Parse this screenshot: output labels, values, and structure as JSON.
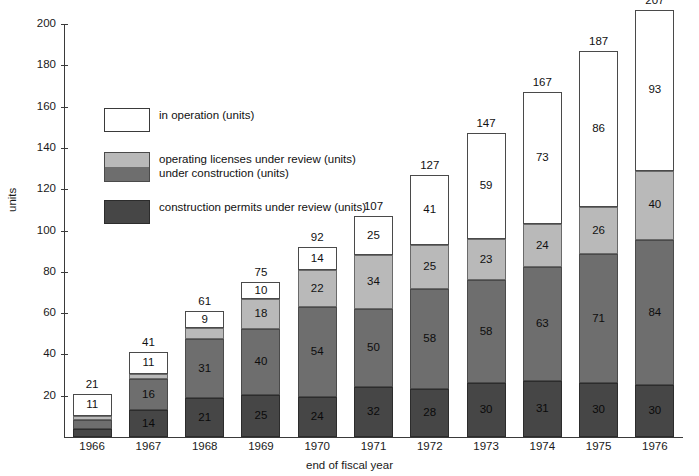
{
  "chart_data": {
    "type": "bar",
    "subtype": "stacked-bar",
    "title": "",
    "xlabel": "end of fiscal year",
    "ylabel": "units",
    "ylim": [
      0,
      200
    ],
    "ytick_step": 20,
    "yticks": [
      0,
      20,
      40,
      60,
      80,
      100,
      120,
      140,
      160,
      180,
      200
    ],
    "grid": false,
    "legend_position": "inside-upper-left",
    "categories": [
      "1966",
      "1967",
      "1968",
      "1969",
      "1970",
      "1971",
      "1972",
      "1973",
      "1974",
      "1975",
      "1976"
    ],
    "series": [
      {
        "name": "in operation (units)",
        "key": "operation",
        "color": "#ffffff",
        "values": [
          11,
          11,
          9,
          10,
          14,
          25,
          41,
          59,
          73,
          86,
          93
        ]
      },
      {
        "name": "operating licenses under review (units)",
        "key": "licenses",
        "color": "#b9b9b9",
        "values": [
          2,
          3,
          6,
          18,
          22,
          34,
          25,
          23,
          24,
          26,
          40
        ]
      },
      {
        "name": "under construction (units)",
        "key": "construction",
        "color": "#6e6e6e",
        "values": [
          4,
          16,
          31,
          40,
          54,
          50,
          58,
          58,
          63,
          71,
          84
        ]
      },
      {
        "name": "construction permits under review (units)",
        "key": "permits",
        "color": "#464646",
        "values": [
          4,
          14,
          21,
          25,
          24,
          32,
          28,
          30,
          31,
          30,
          30
        ]
      }
    ],
    "totals": [
      21,
      41,
      61,
      75,
      92,
      107,
      127,
      147,
      167,
      187,
      207
    ],
    "segment_labels": {
      "operation": [
        "11",
        "11",
        "9",
        "10",
        "14",
        "25",
        "41",
        "59",
        "73",
        "86",
        "93"
      ],
      "licenses": [
        "",
        "3",
        "6",
        "18",
        "22",
        "34",
        "25",
        "23",
        "24",
        "26",
        "40"
      ],
      "construction": [
        "",
        "16",
        "31",
        "40",
        "54",
        "50",
        "58",
        "58",
        "63",
        "71",
        "84"
      ],
      "permits": [
        "",
        "14",
        "21",
        "25",
        "24",
        "32",
        "28",
        "30",
        "31",
        "30",
        "30"
      ]
    }
  },
  "axes": {
    "y_title": "units",
    "x_title": "end of fiscal year",
    "y_tick_labels": [
      "0",
      "20",
      "40",
      "60",
      "80",
      "100",
      "120",
      "140",
      "160",
      "180",
      "200"
    ],
    "x_tick_labels": [
      "1966",
      "1967",
      "1968",
      "1969",
      "1970",
      "1971",
      "1972",
      "1973",
      "1974",
      "1975",
      "1976"
    ]
  },
  "legend": {
    "items": [
      {
        "label": "in operation (units)",
        "swatch": "white"
      },
      {
        "label": "operating licenses under review (units)",
        "swatch": "light-gray"
      },
      {
        "label": "under construction (units)",
        "swatch": "medium-gray"
      },
      {
        "label": "construction permits under review (units)",
        "swatch": "dark-gray"
      }
    ]
  },
  "colors": {
    "operation": "#ffffff",
    "licenses": "#b9b9b9",
    "construction": "#6e6e6e",
    "permits": "#464646",
    "axis": "#3a3a3a",
    "text": "#111111",
    "background": "#ffffff"
  }
}
